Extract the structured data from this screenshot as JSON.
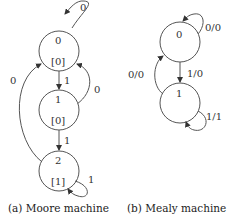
{
  "moore": {
    "caption": "(a) Moore machine",
    "states": [
      {
        "id": "0",
        "output": "[0]"
      },
      {
        "id": "1",
        "output": "[0]"
      },
      {
        "id": "2",
        "output": "[1]"
      }
    ],
    "transitions": [
      {
        "from": "0",
        "to": "0",
        "label": "0"
      },
      {
        "from": "0",
        "to": "1",
        "label": "1"
      },
      {
        "from": "1",
        "to": "0",
        "label": "0"
      },
      {
        "from": "1",
        "to": "2",
        "label": "1"
      },
      {
        "from": "2",
        "to": "0",
        "label": "0"
      },
      {
        "from": "2",
        "to": "2",
        "label": "1"
      }
    ]
  },
  "mealy": {
    "caption": "(b) Mealy machine",
    "states": [
      {
        "id": "0"
      },
      {
        "id": "1"
      }
    ],
    "transitions": [
      {
        "from": "0",
        "to": "0",
        "label": "0/0"
      },
      {
        "from": "0",
        "to": "1",
        "label": "1/0"
      },
      {
        "from": "1",
        "to": "0",
        "label": "0/0"
      },
      {
        "from": "1",
        "to": "1",
        "label": "1/1"
      }
    ]
  }
}
